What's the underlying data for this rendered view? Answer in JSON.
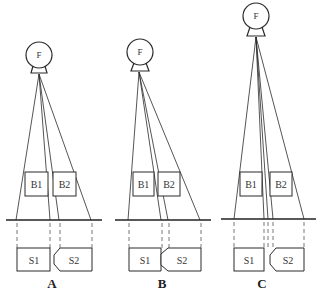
{
  "figure": {
    "type": "projection geometry diagram",
    "panels": [
      {
        "label": "A",
        "focus_label": "F",
        "objects": [
          "B1",
          "B2"
        ],
        "images": [
          "S1",
          "S2"
        ]
      },
      {
        "label": "B",
        "focus_label": "F",
        "objects": [
          "B1",
          "B2"
        ],
        "images": [
          "S1",
          "S2"
        ]
      },
      {
        "label": "C",
        "focus_label": "F",
        "objects": [
          "B1",
          "B2"
        ],
        "images": [
          "S1",
          "S2"
        ]
      }
    ]
  },
  "colors": {
    "stroke": "#2a2a2a",
    "background": "#ffffff"
  }
}
